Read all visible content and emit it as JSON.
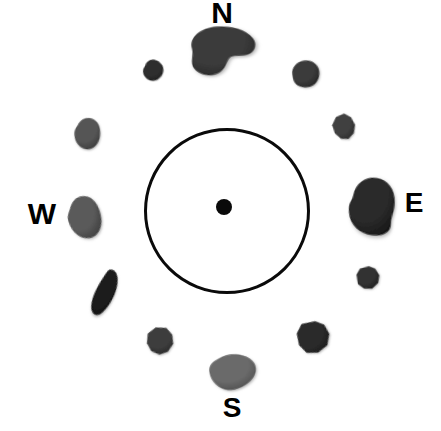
{
  "figure": {
    "background_color": "#ffffff",
    "width": 441,
    "height": 431
  },
  "center_ring": {
    "name": "center-circle",
    "cx": 227,
    "cy": 211,
    "radius": 83,
    "stroke_color": "#0a0a0a",
    "stroke_width": 3
  },
  "center_dot": {
    "name": "center-dot",
    "cx": 224,
    "cy": 207,
    "radius": 8,
    "color": "#0a0a0a"
  },
  "cardinal_labels": [
    {
      "id": "north",
      "text": "N",
      "x": 222,
      "y": 13,
      "font_size": 30,
      "color": "#000000"
    },
    {
      "id": "east",
      "text": "E",
      "x": 414,
      "y": 203,
      "font_size": 28,
      "color": "#000000"
    },
    {
      "id": "south",
      "text": "S",
      "x": 232,
      "y": 408,
      "font_size": 28,
      "color": "#000000"
    },
    {
      "id": "west",
      "text": "W",
      "x": 42,
      "y": 214,
      "font_size": 30,
      "color": "#000000"
    }
  ],
  "stones": [
    {
      "id": "stone-north",
      "position_label": "N",
      "x": 222,
      "y": 51,
      "width": 70,
      "height": 52,
      "rotation": -4,
      "fill": "#3b3b3b",
      "fill_dark": "#262626",
      "shape": "bean"
    },
    {
      "id": "stone-north-northwest",
      "position_label": "NNW",
      "x": 153,
      "y": 70,
      "width": 23,
      "height": 23,
      "rotation": 10,
      "fill": "#2e2e2e",
      "fill_dark": "#1c1c1c",
      "shape": "blob-small"
    },
    {
      "id": "stone-north-northeast",
      "position_label": "NNE",
      "x": 305,
      "y": 74,
      "width": 31,
      "height": 29,
      "rotation": -8,
      "fill": "#3a3a3a",
      "fill_dark": "#222222",
      "shape": "blob-round"
    },
    {
      "id": "stone-northwest",
      "position_label": "NW",
      "x": 87,
      "y": 133,
      "width": 29,
      "height": 34,
      "rotation": 6,
      "fill": "#555555",
      "fill_dark": "#3a3a3a",
      "shape": "blob-oval"
    },
    {
      "id": "stone-northeast",
      "position_label": "NE",
      "x": 344,
      "y": 127,
      "width": 24,
      "height": 27,
      "rotation": -12,
      "fill": "#3f3f3f",
      "fill_dark": "#282828",
      "shape": "angular"
    },
    {
      "id": "stone-west",
      "position_label": "W",
      "x": 84,
      "y": 217,
      "width": 36,
      "height": 46,
      "rotation": -14,
      "fill": "#5a5a5a",
      "fill_dark": "#3c3c3c",
      "shape": "blob-egg"
    },
    {
      "id": "stone-east",
      "position_label": "E",
      "x": 371,
      "y": 206,
      "width": 49,
      "height": 60,
      "rotation": 6,
      "fill": "#2a2a2a",
      "fill_dark": "#161616",
      "shape": "blob-big"
    },
    {
      "id": "stone-southwest",
      "position_label": "SW",
      "x": 106,
      "y": 293,
      "width": 26,
      "height": 50,
      "rotation": 22,
      "fill": "#1f1f1f",
      "fill_dark": "#101010",
      "shape": "blob-long"
    },
    {
      "id": "stone-east-southeast",
      "position_label": "ESE",
      "x": 368,
      "y": 278,
      "width": 25,
      "height": 25,
      "rotation": -6,
      "fill": "#303030",
      "fill_dark": "#1d1d1d",
      "shape": "angular-small"
    },
    {
      "id": "stone-south-southwest",
      "position_label": "SSW",
      "x": 160,
      "y": 341,
      "width": 29,
      "height": 29,
      "rotation": 12,
      "fill": "#3d3d3d",
      "fill_dark": "#262626",
      "shape": "angular"
    },
    {
      "id": "stone-south-southeast",
      "position_label": "SSE",
      "x": 313,
      "y": 337,
      "width": 34,
      "height": 34,
      "rotation": -18,
      "fill": "#2b2b2b",
      "fill_dark": "#171717",
      "shape": "angular-wide"
    },
    {
      "id": "stone-south",
      "position_label": "S",
      "x": 232,
      "y": 372,
      "width": 50,
      "height": 39,
      "rotation": 3,
      "fill": "#6a6a6a",
      "fill_dark": "#4a4a4a",
      "shape": "blob-tri"
    }
  ]
}
